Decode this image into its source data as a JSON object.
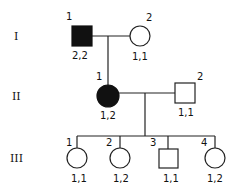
{
  "diagram": {
    "type": "pedigree",
    "generations": [
      {
        "label": "I",
        "individuals": [
          {
            "number": "1",
            "sex": "male",
            "affected": true,
            "genotype": "2,2"
          },
          {
            "number": "2",
            "sex": "female",
            "affected": false,
            "genotype": "1,1"
          }
        ]
      },
      {
        "label": "II",
        "individuals": [
          {
            "number": "1",
            "sex": "female",
            "affected": true,
            "genotype": "1,2"
          },
          {
            "number": "2",
            "sex": "male",
            "affected": false,
            "genotype": "1,1"
          }
        ]
      },
      {
        "label": "III",
        "individuals": [
          {
            "number": "1",
            "sex": "female",
            "affected": false,
            "genotype": "1,1"
          },
          {
            "number": "2",
            "sex": "female",
            "affected": false,
            "genotype": "1,2"
          },
          {
            "number": "3",
            "sex": "male",
            "affected": false,
            "genotype": "1,1"
          },
          {
            "number": "4",
            "sex": "female",
            "affected": false,
            "genotype": "1,2"
          }
        ]
      }
    ],
    "colors": {
      "line": "#222222",
      "affected": "#111111",
      "unaffected": "#ffffff"
    }
  }
}
